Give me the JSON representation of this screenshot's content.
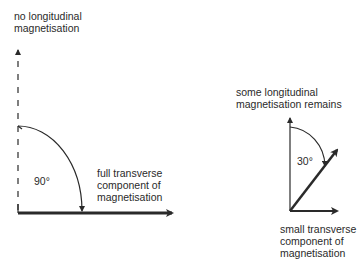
{
  "left_diagram": {
    "top_label": [
      "no longitudinal",
      "magnetisation"
    ],
    "angle_label": "90°",
    "side_label": [
      "full transverse",
      "component of",
      "magnetisation"
    ]
  },
  "right_diagram": {
    "top_label": [
      "some longitudinal",
      "magnetisation remains"
    ],
    "angle_label": "30°",
    "bottom_label": [
      "small transverse",
      "component of",
      "magnetisation"
    ]
  },
  "colors": {
    "ink": "#2a2a2a",
    "background": "#ffffff"
  }
}
